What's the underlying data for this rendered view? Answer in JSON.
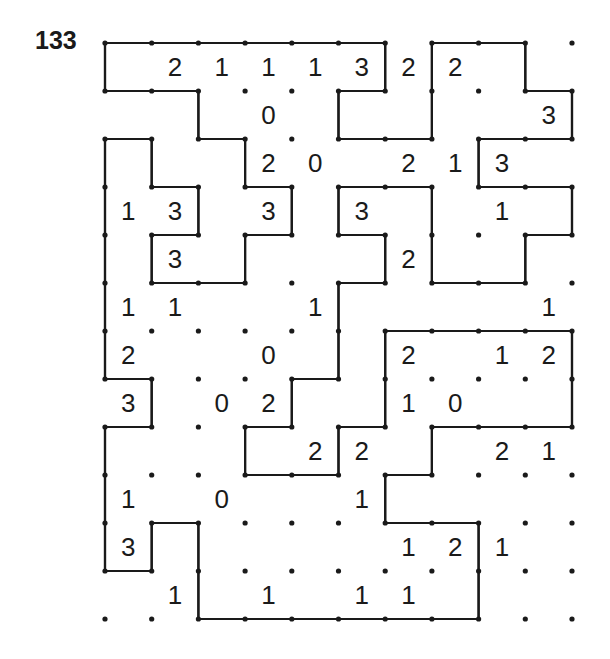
{
  "puzzle": {
    "type": "Slitherlink",
    "number_label": "133",
    "columns": 10,
    "rows": 12,
    "clues": [
      [
        null,
        2,
        1,
        1,
        1,
        3,
        2,
        2,
        null,
        null
      ],
      [
        null,
        null,
        null,
        0,
        null,
        null,
        null,
        null,
        null,
        3
      ],
      [
        null,
        null,
        null,
        2,
        0,
        null,
        2,
        1,
        3,
        null
      ],
      [
        1,
        3,
        null,
        3,
        null,
        3,
        null,
        null,
        1,
        null
      ],
      [
        null,
        3,
        null,
        null,
        null,
        null,
        2,
        null,
        null,
        null
      ],
      [
        1,
        1,
        null,
        null,
        1,
        null,
        null,
        null,
        null,
        1
      ],
      [
        2,
        null,
        null,
        0,
        null,
        null,
        2,
        null,
        1,
        2
      ],
      [
        3,
        null,
        0,
        2,
        null,
        null,
        1,
        0,
        null,
        null
      ],
      [
        null,
        null,
        null,
        null,
        2,
        2,
        null,
        null,
        2,
        1
      ],
      [
        1,
        null,
        0,
        null,
        null,
        1,
        null,
        null,
        null,
        null
      ],
      [
        3,
        null,
        null,
        null,
        null,
        null,
        1,
        2,
        1,
        null
      ],
      [
        null,
        1,
        null,
        1,
        null,
        1,
        1,
        null,
        null,
        null
      ]
    ],
    "loop_vertices": [
      [
        0,
        0
      ],
      [
        6,
        0
      ],
      [
        6,
        1
      ],
      [
        5,
        1
      ],
      [
        5,
        2
      ],
      [
        7,
        2
      ],
      [
        7,
        0
      ],
      [
        9,
        0
      ],
      [
        9,
        1
      ],
      [
        10,
        1
      ],
      [
        10,
        2
      ],
      [
        8,
        2
      ],
      [
        8,
        3
      ],
      [
        10,
        3
      ],
      [
        10,
        4
      ],
      [
        9,
        4
      ],
      [
        9,
        5
      ],
      [
        7,
        5
      ],
      [
        7,
        3
      ],
      [
        5,
        3
      ],
      [
        5,
        4
      ],
      [
        6,
        4
      ],
      [
        6,
        5
      ],
      [
        5,
        5
      ],
      [
        5,
        7
      ],
      [
        4,
        7
      ],
      [
        4,
        8
      ],
      [
        3,
        8
      ],
      [
        3,
        9
      ],
      [
        5,
        9
      ],
      [
        5,
        8
      ],
      [
        6,
        8
      ],
      [
        6,
        6
      ],
      [
        10,
        6
      ],
      [
        10,
        8
      ],
      [
        7,
        8
      ],
      [
        7,
        9
      ],
      [
        6,
        9
      ],
      [
        6,
        10
      ],
      [
        8,
        10
      ],
      [
        8,
        12
      ],
      [
        2,
        12
      ],
      [
        2,
        10
      ],
      [
        1,
        10
      ],
      [
        1,
        11
      ],
      [
        0,
        11
      ],
      [
        0,
        8
      ],
      [
        1,
        8
      ],
      [
        1,
        7
      ],
      [
        0,
        7
      ],
      [
        0,
        2
      ],
      [
        1,
        2
      ],
      [
        1,
        3
      ],
      [
        2,
        3
      ],
      [
        2,
        4
      ],
      [
        1,
        4
      ],
      [
        1,
        5
      ],
      [
        3,
        5
      ],
      [
        3,
        4
      ],
      [
        4,
        4
      ],
      [
        4,
        3
      ],
      [
        3,
        3
      ],
      [
        3,
        2
      ],
      [
        2,
        2
      ],
      [
        2,
        1
      ],
      [
        0,
        1
      ]
    ],
    "colors": {
      "ink": "#1a1a1a",
      "background": "#ffffff"
    }
  }
}
